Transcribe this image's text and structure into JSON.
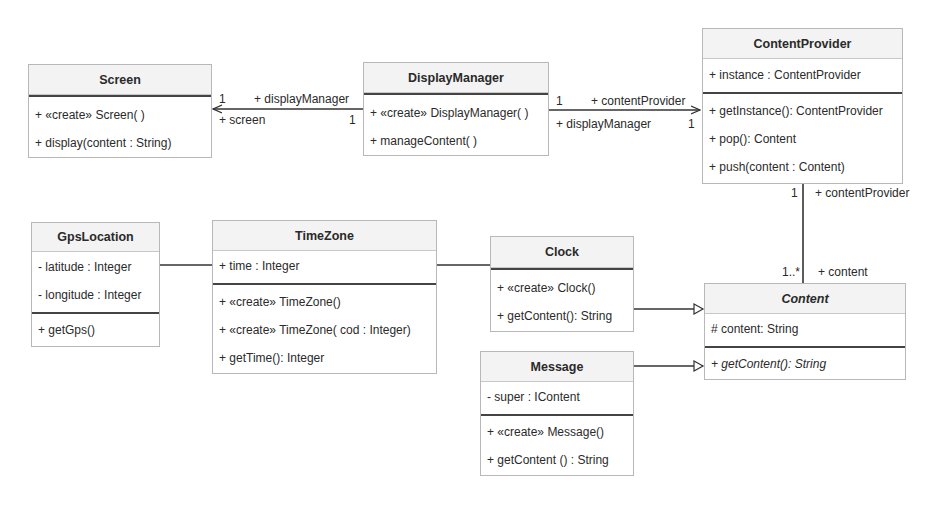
{
  "diagram": {
    "type": "UML class diagram",
    "classes": {
      "screen": {
        "name": "Screen",
        "attributes": [],
        "operations": [
          "+ «create» Screen( )",
          "+ display(content : String)"
        ]
      },
      "display_manager": {
        "name": "DisplayManager",
        "attributes": [],
        "operations": [
          "+ «create» DisplayManager( )",
          "+ manageContent( )"
        ]
      },
      "content_provider": {
        "name": "ContentProvider",
        "attributes": [
          "+ instance : ContentProvider"
        ],
        "operations": [
          "+ getInstance(): ContentProvider",
          "+ pop(): Content",
          "+ push(content : Content)"
        ]
      },
      "gps_location": {
        "name": "GpsLocation",
        "attributes": [
          "- latitude : Integer",
          "- longitude : Integer"
        ],
        "operations": [
          "+ getGps()"
        ]
      },
      "time_zone": {
        "name": "TimeZone",
        "attributes": [
          "+ time : Integer"
        ],
        "operations": [
          "+ «create» TimeZone()",
          "+ «create» TimeZone( cod : Integer)",
          "+ getTime(): Integer"
        ]
      },
      "clock": {
        "name": "Clock",
        "attributes": [],
        "operations": [
          "+ «create» Clock()",
          "+ getContent(): String"
        ]
      },
      "content": {
        "name": "Content",
        "abstract": true,
        "attributes": [
          "# content: String"
        ],
        "operations": [
          "+ getContent(): String"
        ]
      },
      "message": {
        "name": "Message",
        "attributes": [
          "- super : IContent"
        ],
        "operations": [
          "+ «create» Message()",
          "+ getContent () : String"
        ]
      }
    },
    "relations": {
      "dm_screen": {
        "type": "directed association",
        "from": "DisplayManager",
        "to": "Screen",
        "near_target_mult": "1",
        "near_target_role_top": "+ displayManager",
        "near_target_role_bottom": "+ screen",
        "near_source_mult": "1"
      },
      "dm_cp": {
        "type": "directed association",
        "from": "DisplayManager",
        "to": "ContentProvider",
        "near_source_mult": "1",
        "role_top": "+ contentProvider",
        "role_bottom": "+ displayManager",
        "near_target_mult": "1"
      },
      "cp_content": {
        "type": "association",
        "from": "ContentProvider",
        "to": "Content",
        "top_mult": "1",
        "top_role": "+ contentProvider",
        "bottom_mult": "1..*",
        "bottom_role": "+ content"
      },
      "gps_tz": {
        "type": "association",
        "from": "GpsLocation",
        "to": "TimeZone"
      },
      "tz_clock": {
        "type": "association",
        "from": "TimeZone",
        "to": "Clock"
      },
      "clock_content": {
        "type": "realization/generalization",
        "from": "Clock",
        "to": "Content"
      },
      "message_content": {
        "type": "realization/generalization",
        "from": "Message",
        "to": "Content"
      }
    }
  }
}
